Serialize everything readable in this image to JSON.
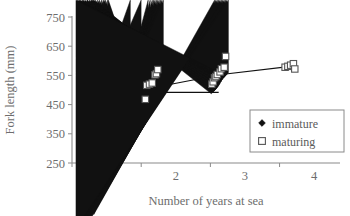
{
  "chart_data": {
    "type": "scatter",
    "title": "",
    "xlabel": "Number of years at sea",
    "ylabel": "Fork length (mm)",
    "xlim": [
      0.5,
      4.2
    ],
    "ylim": [
      250,
      750
    ],
    "xticks": [
      1,
      2,
      3,
      4
    ],
    "xtick_labels": [
      "1",
      "2",
      "3",
      "4"
    ],
    "yticks": [
      250,
      350,
      450,
      550,
      650,
      750
    ],
    "ytick_labels": [
      "250",
      "350",
      "450",
      "550",
      "650",
      "750"
    ],
    "grid": false,
    "legend_position": "bottom-right",
    "series": [
      {
        "name": "immature",
        "marker": "filled-diamond",
        "color": "#111111",
        "points": [
          [
            0.66,
            325
          ],
          [
            0.72,
            362
          ],
          [
            1.6,
            437
          ],
          [
            1.63,
            440
          ],
          [
            1.66,
            447
          ],
          [
            1.68,
            452
          ],
          [
            1.7,
            455
          ],
          [
            1.72,
            461
          ],
          [
            1.74,
            468
          ],
          [
            1.76,
            474
          ],
          [
            1.78,
            481
          ],
          [
            1.8,
            488
          ],
          [
            1.82,
            494
          ],
          [
            2.56,
            487
          ],
          [
            2.58,
            492
          ],
          [
            2.6,
            497
          ],
          [
            2.62,
            503
          ],
          [
            2.64,
            510
          ],
          [
            2.66,
            518
          ],
          [
            2.68,
            526
          ],
          [
            2.7,
            533
          ],
          [
            2.72,
            538
          ],
          [
            2.74,
            543
          ],
          [
            2.76,
            548
          ]
        ]
      },
      {
        "name": "maturing",
        "marker": "open-square",
        "color": "#555555",
        "points": [
          [
            1.56,
            468
          ],
          [
            1.58,
            516
          ],
          [
            1.62,
            520
          ],
          [
            1.66,
            524
          ],
          [
            1.7,
            552
          ],
          [
            1.72,
            556
          ],
          [
            1.74,
            570
          ],
          [
            2.52,
            520
          ],
          [
            2.54,
            528
          ],
          [
            2.56,
            542
          ],
          [
            2.58,
            546
          ],
          [
            2.6,
            553
          ],
          [
            2.64,
            562
          ],
          [
            2.66,
            573
          ],
          [
            2.7,
            578
          ],
          [
            2.72,
            615
          ],
          [
            3.58,
            578
          ],
          [
            3.62,
            581
          ],
          [
            3.66,
            585
          ],
          [
            3.7,
            590
          ],
          [
            3.72,
            572
          ]
        ]
      }
    ],
    "connector_lines": [
      {
        "name": "immature-trend",
        "points": [
          [
            0.72,
            362
          ],
          [
            1.8,
            492
          ],
          [
            2.62,
            492
          ]
        ]
      },
      {
        "name": "maturing-trend",
        "points": [
          [
            0.72,
            362
          ],
          [
            1.78,
            513
          ],
          [
            2.66,
            553
          ],
          [
            3.66,
            581
          ]
        ]
      }
    ],
    "legend": [
      {
        "label": "immature",
        "marker": "filled-diamond"
      },
      {
        "label": "maturing",
        "marker": "open-square"
      }
    ]
  }
}
